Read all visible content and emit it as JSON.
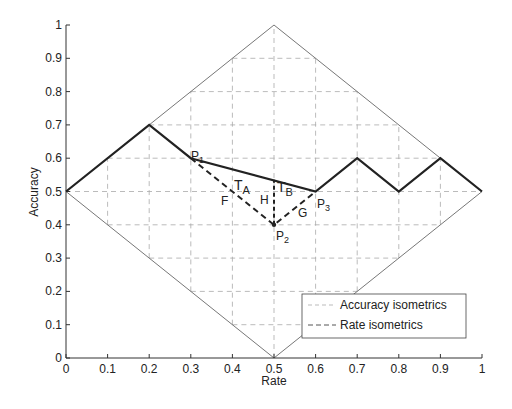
{
  "chart_data": {
    "type": "line",
    "title": "",
    "xlabel": "Rate",
    "ylabel": "Accuracy",
    "xlim": [
      0,
      1
    ],
    "ylim": [
      0,
      1
    ],
    "xticks": [
      "0",
      "0.1",
      "0.2",
      "0.3",
      "0.4",
      "0.5",
      "0.6",
      "0.7",
      "0.8",
      "0.9",
      "1"
    ],
    "yticks": [
      "0",
      "0.1",
      "0.2",
      "0.3",
      "0.4",
      "0.5",
      "0.6",
      "0.7",
      "0.8",
      "0.9",
      "1"
    ],
    "grid": "dashed",
    "legend_position": "lower right",
    "legend": [
      "Accuracy isometrics",
      "Rate isometrics"
    ],
    "series": [
      {
        "name": "Feasible region boundary (diamond)",
        "style": "thin-gray",
        "x": [
          0,
          0.5,
          1,
          0.5,
          0
        ],
        "y": [
          0.5,
          1,
          0.5,
          0,
          0.5
        ]
      },
      {
        "name": "Convex hull path",
        "style": "thick-solid",
        "x": [
          0,
          0.2,
          0.3,
          0.6,
          0.7,
          0.8,
          0.9,
          1
        ],
        "y": [
          0.5,
          0.7,
          0.6,
          0.5,
          0.6,
          0.5,
          0.6,
          0.5
        ]
      },
      {
        "name": "Path via P2",
        "style": "thick-dashed",
        "x": [
          0.3,
          0.5,
          0.6
        ],
        "y": [
          0.6,
          0.4,
          0.5
        ]
      },
      {
        "name": "H vertical segment",
        "style": "thick-dashed",
        "x": [
          0.5,
          0.5
        ],
        "y": [
          0.4,
          0.535
        ]
      }
    ],
    "points": [
      {
        "label": "P1",
        "x": 0.3,
        "y": 0.6
      },
      {
        "label": "P2",
        "x": 0.5,
        "y": 0.4
      },
      {
        "label": "P3",
        "x": 0.6,
        "y": 0.5
      }
    ],
    "annotations": [
      {
        "text": "T",
        "sub": "A",
        "x": 0.415,
        "y": 0.55
      },
      {
        "text": "T",
        "sub": "B",
        "x": 0.515,
        "y": 0.53
      },
      {
        "text": "F",
        "x": 0.385,
        "y": 0.485
      },
      {
        "text": "H",
        "x": 0.475,
        "y": 0.485
      },
      {
        "text": "G",
        "x": 0.555,
        "y": 0.445
      }
    ]
  },
  "labels": {
    "xlabel": "Rate",
    "ylabel": "Accuracy",
    "legend_accuracy": "Accuracy isometrics",
    "legend_rate": "Rate isometrics",
    "p1": "P",
    "p1_sub": "1",
    "p2": "P",
    "p2_sub": "2",
    "p3": "P",
    "p3_sub": "3",
    "ta": "T",
    "ta_sub": "A",
    "tb": "T",
    "tb_sub": "B",
    "f": "F",
    "h": "H",
    "g": "G"
  },
  "ticks": {
    "x": [
      "0",
      "0.1",
      "0.2",
      "0.3",
      "0.4",
      "0.5",
      "0.6",
      "0.7",
      "0.8",
      "0.9",
      "1"
    ],
    "y": [
      "0",
      "0.1",
      "0.2",
      "0.3",
      "0.4",
      "0.5",
      "0.6",
      "0.7",
      "0.8",
      "0.9",
      "1"
    ]
  },
  "colors": {
    "thick_line": "#222222",
    "thin_line": "#777777",
    "grid": "#aaaaaa"
  }
}
